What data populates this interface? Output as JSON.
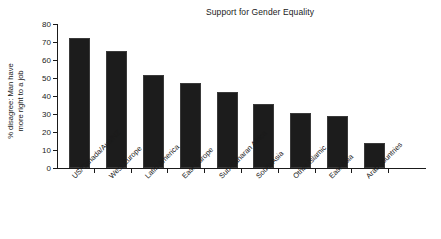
{
  "chart_data": {
    "type": "bar",
    "title": "Support for Gender Equality",
    "xlabel": "",
    "ylabel_line1": "% disagree: Man have",
    "ylabel_line2": "more right to a job",
    "ylabel": "% disagree: Man have more right to a job",
    "categories": [
      "US/Canada/Aus/NZ",
      "West Europe",
      "Latin America",
      "East Europe",
      "Sub-Saharan Africa",
      "South Asia",
      "Other Islamic",
      "East Asia",
      "Arab countries"
    ],
    "values": [
      72,
      65,
      51.5,
      47,
      42,
      35.5,
      30.5,
      29,
      14
    ],
    "ylim": [
      0,
      80
    ],
    "yticks": [
      0,
      10,
      20,
      30,
      40,
      50,
      60,
      70,
      80
    ],
    "ytick_labels": [
      "0",
      "10",
      "20",
      "30",
      "40",
      "50",
      "60",
      "70",
      "80"
    ],
    "grid": false,
    "legend": false,
    "bar_color": "#1c1c1c",
    "bar_edge_color": "#3a3a3a",
    "axis_color": "#1a1a1a",
    "background": "#ffffff"
  }
}
